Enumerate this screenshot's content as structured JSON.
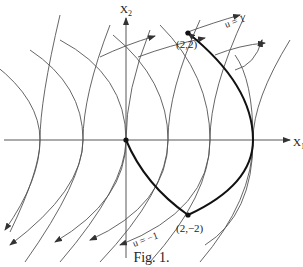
{
  "figure": {
    "caption": "Fig. 1.",
    "axes": {
      "x_label": "X",
      "x_sub": "1",
      "y_label": "X",
      "y_sub": "2"
    },
    "points": [
      {
        "label": "(2,2)",
        "x": 2,
        "y": 2
      },
      {
        "label": "(2,−2)",
        "x": 2,
        "y": -2
      },
      {
        "label": "",
        "x": 0,
        "y": 0
      }
    ],
    "curve_labels": {
      "upper": "u = 1",
      "lower": "u = −1"
    },
    "colors": {
      "curves": "#555555",
      "bold_path": "#111111",
      "background": "#ffffff"
    }
  }
}
